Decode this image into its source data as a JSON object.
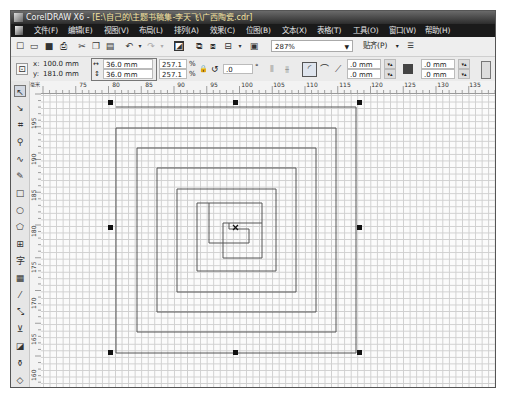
{
  "window": {
    "app_name": "CorelDRAW X6",
    "title_separator": " - ",
    "document_path": "[E:\\自己的\\主题书稿集-李天飞\\广西陶瓷.cdr]"
  },
  "menubar": {
    "items": [
      {
        "label": "文件(F)",
        "x": 23
      },
      {
        "label": "编辑(E)",
        "x": 57
      },
      {
        "label": "视图(V)",
        "x": 93
      },
      {
        "label": "布局(L)",
        "x": 128
      },
      {
        "label": "排列(A)",
        "x": 163
      },
      {
        "label": "效果(C)",
        "x": 199
      },
      {
        "label": "位图(B)",
        "x": 235
      },
      {
        "label": "文本(X)",
        "x": 271
      },
      {
        "label": "表格(T)",
        "x": 306
      },
      {
        "label": "工具(O)",
        "x": 342
      },
      {
        "label": "窗口(W)",
        "x": 378
      },
      {
        "label": "帮助(H)",
        "x": 414
      }
    ]
  },
  "toolbar": {
    "zoom_level": "287%",
    "snap_label": "贴齐(P)",
    "icons": [
      {
        "name": "new-document-icon",
        "glyph": "☐",
        "x": 4
      },
      {
        "name": "open-icon",
        "glyph": "▭",
        "x": 18
      },
      {
        "name": "save-icon",
        "glyph": "■",
        "x": 33
      },
      {
        "name": "print-icon",
        "glyph": "⎙",
        "x": 47
      },
      {
        "name": "cut-icon",
        "glyph": "✂",
        "x": 66
      },
      {
        "name": "copy-icon",
        "glyph": "❐",
        "x": 80
      },
      {
        "name": "paste-icon",
        "glyph": "▤",
        "x": 94
      },
      {
        "name": "undo-icon",
        "glyph": "↶",
        "x": 113
      },
      {
        "name": "redo-icon",
        "glyph": "↷",
        "x": 135
      },
      {
        "name": "import-icon",
        "glyph": "◩",
        "x": 163
      },
      {
        "name": "export-icon",
        "glyph": "⧉",
        "x": 183
      },
      {
        "name": "publish-pdf-icon",
        "glyph": "⧈",
        "x": 197
      },
      {
        "name": "application-launcher-icon",
        "glyph": "▾",
        "x": 216
      },
      {
        "name": "welcome-screen-icon",
        "glyph": "▣",
        "x": 238
      }
    ]
  },
  "propertybar": {
    "x_label": "x:",
    "x_value": "100.0 mm",
    "y_label": "y:",
    "y_value": "181.0 mm",
    "width_value": "36.0 mm",
    "height_value": "36.0 mm",
    "scale_x": "257.1",
    "scale_y": "257.1",
    "percent": "%",
    "rotation": ".0",
    "degree": "°",
    "corner_x1": ".0 mm",
    "corner_y1": ".0 mm",
    "corner_x2": ".0 mm",
    "corner_y2": ".0 mm"
  },
  "rulers": {
    "unit_corner": "毫米",
    "horizontal": [
      {
        "label": "75",
        "x": 42
      },
      {
        "label": "80",
        "x": 75
      },
      {
        "label": "85",
        "x": 108
      },
      {
        "label": "90",
        "x": 140
      },
      {
        "label": "95",
        "x": 173
      },
      {
        "label": "100",
        "x": 206
      },
      {
        "label": "105",
        "x": 238
      },
      {
        "label": "110",
        "x": 271
      },
      {
        "label": "115",
        "x": 304
      },
      {
        "label": "120",
        "x": 336
      },
      {
        "label": "125",
        "x": 369
      },
      {
        "label": "130",
        "x": 402
      },
      {
        "label": "135",
        "x": 434
      }
    ],
    "vertical": [
      {
        "label": "195",
        "y": 30
      },
      {
        "label": "190",
        "y": 66
      },
      {
        "label": "185",
        "y": 102
      },
      {
        "label": "180",
        "y": 138
      },
      {
        "label": "175",
        "y": 174
      },
      {
        "label": "170",
        "y": 210
      },
      {
        "label": "165",
        "y": 246
      },
      {
        "label": "160",
        "y": 282
      }
    ]
  },
  "toolbox": {
    "tools": [
      {
        "name": "pick-tool-icon",
        "glyph": "↖",
        "y": 4,
        "selected": true
      },
      {
        "name": "shape-tool-icon",
        "glyph": "↘",
        "y": 21
      },
      {
        "name": "crop-tool-icon",
        "glyph": "⌗",
        "y": 38
      },
      {
        "name": "zoom-tool-icon",
        "glyph": "🔍",
        "y": 55
      },
      {
        "name": "freehand-tool-icon",
        "glyph": "∿",
        "y": 72
      },
      {
        "name": "smart-fill-tool-icon",
        "glyph": "✎",
        "y": 89
      },
      {
        "name": "rectangle-tool-icon",
        "glyph": "□",
        "y": 106
      },
      {
        "name": "ellipse-tool-icon",
        "glyph": "○",
        "y": 123
      },
      {
        "name": "polygon-tool-icon",
        "glyph": "⬠",
        "y": 140
      },
      {
        "name": "graph-paper-tool-icon",
        "glyph": "⊞",
        "y": 157
      },
      {
        "name": "text-tool-icon",
        "glyph": "字",
        "y": 174
      },
      {
        "name": "table-tool-icon",
        "glyph": "▦",
        "y": 191
      },
      {
        "name": "dimension-tool-icon",
        "glyph": "⁄",
        "y": 208
      },
      {
        "name": "connector-tool-icon",
        "glyph": "⤡",
        "y": 225
      },
      {
        "name": "blend-tool-icon",
        "glyph": "⊻",
        "y": 242
      },
      {
        "name": "transparency-tool-icon",
        "glyph": "◪",
        "y": 259
      },
      {
        "name": "eyedropper-tool-icon",
        "glyph": "⚲",
        "y": 276
      },
      {
        "name": "fill-tool-icon",
        "glyph": "◇",
        "y": 293
      }
    ]
  },
  "canvas": {
    "object": "square-spiral",
    "line_color": "#555555",
    "selection_handles": "8 black handles around 36.0 x 36.0 mm spiral"
  }
}
